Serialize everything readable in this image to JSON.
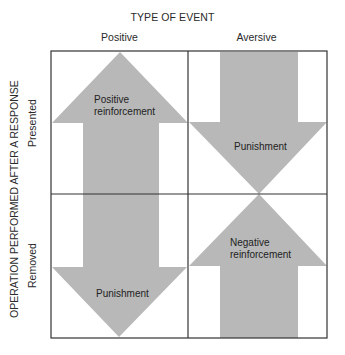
{
  "header": {
    "title": "TYPE OF EVENT",
    "columns": [
      "Positive",
      "Aversive"
    ]
  },
  "row_axis": {
    "title": "OPERATION PERFORMED AFTER A RESPONSE",
    "rows": [
      "Presented",
      "Removed"
    ]
  },
  "cells": [
    {
      "row": "Presented",
      "column": "Positive",
      "label_line1": "Positive",
      "label_line2": "reinforcement",
      "arrow": "up"
    },
    {
      "row": "Presented",
      "column": "Aversive",
      "label_line1": "Punishment",
      "label_line2": "",
      "arrow": "down"
    },
    {
      "row": "Removed",
      "column": "Positive",
      "label_line1": "Punishment",
      "label_line2": "",
      "arrow": "down"
    },
    {
      "row": "Removed",
      "column": "Aversive",
      "label_line1": "Negative",
      "label_line2": "reinforcement",
      "arrow": "up"
    }
  ],
  "colors": {
    "arrow_fill": "#b8b8b8",
    "grid_line": "#333333",
    "text": "#2a2a2a"
  }
}
